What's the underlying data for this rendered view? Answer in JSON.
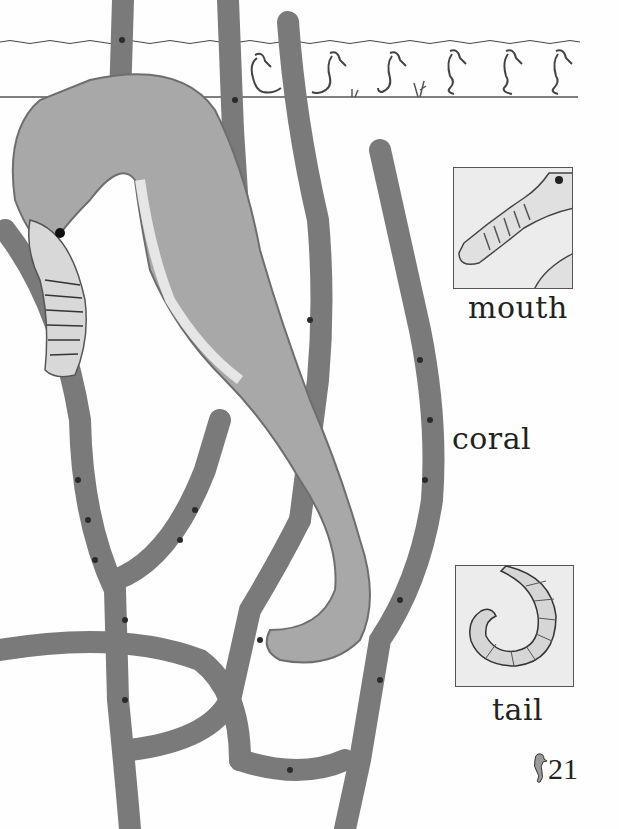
{
  "page": {
    "page_number": "21",
    "labels": {
      "mouth": "mouth",
      "coral": "coral",
      "tail": "tail"
    },
    "insets": [
      {
        "name": "mouth",
        "subject": "close-up drawing of seahorse snout"
      },
      {
        "name": "tail",
        "subject": "close-up drawing of curled seahorse tail"
      }
    ],
    "strip": {
      "subject": "sequence of seahorse drawings showing tail movement",
      "seahorse_count": 6
    },
    "photo": {
      "subject": "seahorse clinging to branching coral",
      "colors": {
        "coral": "#7a7a7a",
        "coral_dark": "#4a4a4a",
        "coral_spots": "#2a2a2a",
        "seahorse": "#a8a8a8",
        "seahorse_light": "#d8d8d8"
      }
    },
    "page_icon": "seahorse-icon"
  }
}
